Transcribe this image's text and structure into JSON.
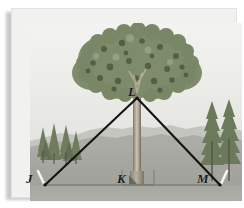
{
  "figure": {
    "type": "geometry-illustration",
    "vertices": [
      {
        "id": "J",
        "label": "J",
        "role": "left-ground-stake",
        "x": 33,
        "y": 176
      },
      {
        "id": "K",
        "label": "K",
        "role": "tree-base-right-angle",
        "x": 124,
        "y": 176
      },
      {
        "id": "L",
        "label": "L",
        "role": "apex-on-tree",
        "x": 125,
        "y": 89
      },
      {
        "id": "M",
        "label": "M",
        "role": "right-ground-stake",
        "x": 208,
        "y": 176
      }
    ],
    "segments": [
      {
        "name": "JL",
        "from": "J",
        "to": "L",
        "style": "solid-black"
      },
      {
        "name": "LM",
        "from": "L",
        "to": "M",
        "style": "solid-black"
      },
      {
        "name": "JM",
        "from": "J",
        "to": "M",
        "style": "thin-gray-baseline"
      },
      {
        "name": "LK",
        "from": "L",
        "to": "K",
        "style": "tree-trunk"
      }
    ],
    "markers": [
      {
        "name": "right-angle-marker",
        "at": "K",
        "symbol": "square"
      },
      {
        "name": "stake-left",
        "at": "J",
        "symbol": "white-stake"
      },
      {
        "name": "stake-right",
        "at": "M",
        "symbol": "white-stake"
      }
    ],
    "labels": {
      "J": "J",
      "K": "K",
      "L": "L",
      "M": "M"
    }
  },
  "scene": {
    "sky_color": "#ebebe8",
    "mountain_far_color": "#b9bab4",
    "mountain_near_color": "#9ea09a",
    "ground_color": "#a5a69f",
    "foliage_color": "#7d8a6a",
    "trunk_color": "#b2a894",
    "line_color": "#131313",
    "baseline_color": "#6e6f69",
    "label_color": "#1b1b1b",
    "plate_color": "#f1f1ef",
    "elements": [
      {
        "name": "big-deciduous-tree",
        "position": "center"
      },
      {
        "name": "conifer-cluster-left",
        "position": "left"
      },
      {
        "name": "conifer-pair-right",
        "position": "right"
      },
      {
        "name": "mountain-ridge",
        "position": "background"
      }
    ]
  }
}
